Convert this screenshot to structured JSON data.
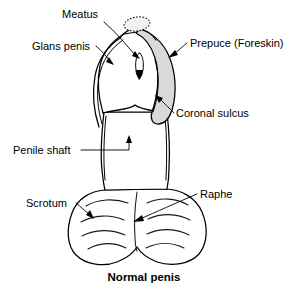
{
  "figure": {
    "title": "Normal penis",
    "caption": "Normal penis",
    "background_color": "#ffffff",
    "line_color": "#000000",
    "prepuce_shade_color": "#d9d9d9"
  },
  "labels": [
    {
      "id": "meatus",
      "text": "Meatus",
      "x": 62,
      "y": 18,
      "anchor": "start",
      "target_x": 139,
      "target_y": 57,
      "points_to": "urethral-opening"
    },
    {
      "id": "glans-penis",
      "text": "Glans penis",
      "x": 32,
      "y": 50,
      "anchor": "start",
      "target_x": 110,
      "target_y": 63,
      "points_to": "glans-head"
    },
    {
      "id": "prepuce",
      "text": "Prepuce (Foreskin)",
      "x": 190,
      "y": 47,
      "anchor": "start",
      "target_x": 170,
      "target_y": 55,
      "points_to": "foreskin-band"
    },
    {
      "id": "coronal-sulcus",
      "text": "Coronal sulcus",
      "x": 176,
      "y": 116,
      "anchor": "start",
      "target_x": 157,
      "target_y": 99,
      "points_to": "corona-groove"
    },
    {
      "id": "penile-shaft",
      "text": "Penile shaft",
      "x": 13,
      "y": 154,
      "anchor": "start",
      "target_x": 113,
      "target_y": 147,
      "points_to": "shaft-body"
    },
    {
      "id": "scrotum",
      "text": "Scrotum",
      "x": 26,
      "y": 207,
      "anchor": "start",
      "target_x": 89,
      "target_y": 216,
      "points_to": "scrotal-sac"
    },
    {
      "id": "raphe",
      "text": "Raphe",
      "x": 200,
      "y": 198,
      "anchor": "start",
      "target_x": 138,
      "target_y": 218,
      "points_to": "median-raphe-line"
    }
  ],
  "anatomy_parts": [
    {
      "id": "glans-head",
      "name": "Glans penis"
    },
    {
      "id": "foreskin-band",
      "name": "Prepuce (Foreskin)"
    },
    {
      "id": "urethral-opening",
      "name": "Meatus"
    },
    {
      "id": "corona-groove",
      "name": "Coronal sulcus"
    },
    {
      "id": "shaft-body",
      "name": "Penile shaft"
    },
    {
      "id": "scrotal-sac",
      "name": "Scrotum"
    },
    {
      "id": "median-raphe-line",
      "name": "Raphe"
    }
  ],
  "caption": {
    "text": "Normal penis",
    "x": 144,
    "y": 281
  }
}
